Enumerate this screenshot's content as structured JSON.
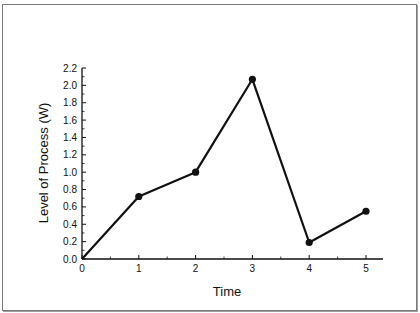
{
  "chart_data": {
    "type": "line",
    "title": "",
    "xlabel": "Time",
    "ylabel": "Level of Process (W)",
    "x": [
      0,
      1,
      2,
      3,
      4,
      5
    ],
    "series": [
      {
        "name": "Level of Process",
        "values": [
          0.0,
          0.72,
          1.0,
          2.07,
          0.19,
          0.55
        ]
      }
    ],
    "xlim": [
      0,
      5.3
    ],
    "ylim": [
      0,
      2.2
    ],
    "xticks": [
      "0",
      "1",
      "2",
      "3",
      "4",
      "5"
    ],
    "yticks": [
      "0.0",
      "0.2",
      "0.4",
      "0.6",
      "0.8",
      "1.0",
      "1.2",
      "1.4",
      "1.6",
      "1.8",
      "2.0",
      "2.2"
    ],
    "grid": false,
    "legend": null,
    "markers": "filled-circle"
  }
}
